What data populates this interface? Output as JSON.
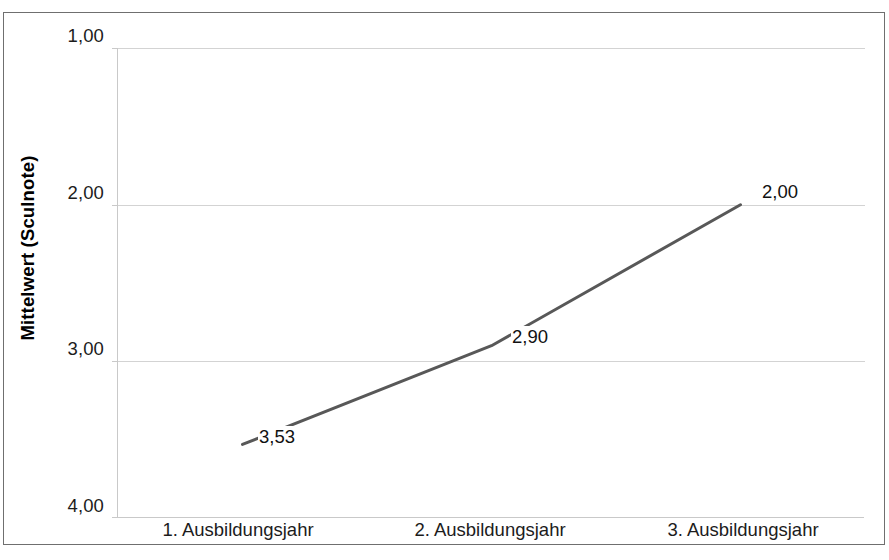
{
  "chart_data": {
    "type": "line",
    "title": "",
    "subtitle": "",
    "xlabel": "",
    "ylabel": "Mittelwert (Sculnote)",
    "categories": [
      "1. Ausbildungsjahr",
      "2. Ausbildungsjahr",
      "3. Ausbildungsjahr"
    ],
    "values": [
      3.53,
      2.9,
      2.0
    ],
    "point_labels": [
      "3,53",
      "2,90",
      "2,00"
    ],
    "series": [
      {
        "name": "",
        "values": [
          3.53,
          2.9,
          2.0
        ]
      }
    ],
    "ylim": [
      1.0,
      4.0
    ],
    "y_inverted": true,
    "y_ticks": [
      1.0,
      2.0,
      3.0,
      4.0
    ],
    "y_tick_labels": [
      "1,00",
      "2,00",
      "3,00",
      "4,00"
    ],
    "grid": "horizontal",
    "legend": "none",
    "line_color": "#585858",
    "grid_color": "#d3d3d3",
    "axis_color": "#c9c9c9",
    "frame_color": "#6f6f6f",
    "background": "#ffffff"
  }
}
